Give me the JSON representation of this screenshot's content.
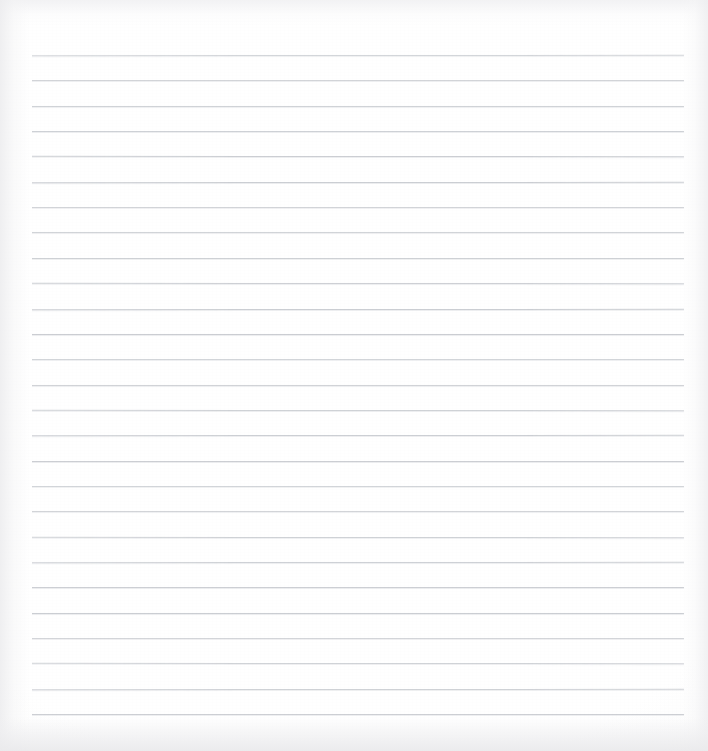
{
  "document": {
    "kind": "scanned-lined-notebook-page",
    "title": "",
    "body_text": "",
    "is_blank": true,
    "page_width": 708,
    "page_height": 751
  },
  "colors": {
    "page_background": "#ffffff",
    "scan_background": "#f2f2f3",
    "paper": "#ffffff",
    "rule_line": "#c9ccd1",
    "edge_shadow": "#eeeef0"
  },
  "ruling": {
    "line_count": 27,
    "first_line_y": 55,
    "line_spacing": 25.35,
    "line_left_x": 32,
    "line_right_x": 684,
    "line_thickness": 1,
    "margin_rule": "none",
    "orientation": "horizontal"
  },
  "artifacts": {
    "bleached_patch": {
      "x": 556,
      "y": 441,
      "width": 52,
      "height": 5
    }
  }
}
